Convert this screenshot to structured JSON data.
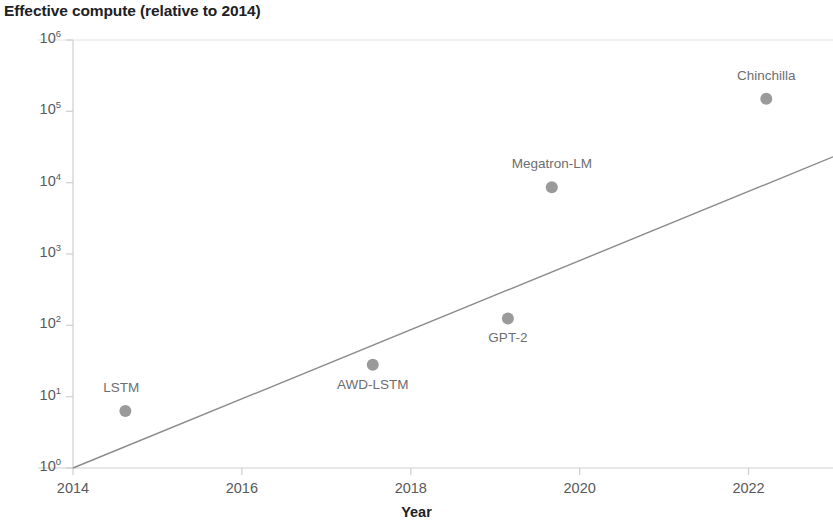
{
  "chart_data": {
    "type": "scatter",
    "title": "Effective compute (relative to 2014)",
    "xlabel": "Year",
    "ylabel": "",
    "xlim": [
      2013.5,
      2023.0
    ],
    "ylim": [
      1,
      1000000
    ],
    "yscale": "log",
    "grid": false,
    "legend": "none",
    "xticks": [
      "2014",
      "2016",
      "2018",
      "2020",
      "2022"
    ],
    "xtick_values": [
      2014,
      2016,
      2018,
      2020,
      2022
    ],
    "yticks": [
      "10^0",
      "10^1",
      "10^2",
      "10^3",
      "10^4",
      "10^5",
      "10^6"
    ],
    "ytick_values": [
      1,
      10,
      100,
      1000,
      10000,
      100000,
      1000000
    ],
    "ytick_mantissa": [
      "10",
      "10",
      "10",
      "10",
      "10",
      "10",
      "10"
    ],
    "ytick_exponent": [
      "0",
      "1",
      "2",
      "3",
      "4",
      "5",
      "6"
    ],
    "points": [
      {
        "name": "LSTM",
        "x": 2014.62,
        "y": 6.3,
        "label_dx": -4,
        "label_dy": -22
      },
      {
        "name": "AWD-LSTM",
        "x": 2017.55,
        "y": 28,
        "label_dx": 0,
        "label_dy": 21
      },
      {
        "name": "GPT-2",
        "x": 2019.15,
        "y": 125,
        "label_dx": 0,
        "label_dy": 21
      },
      {
        "name": "Megatron-LM",
        "x": 2019.67,
        "y": 8600,
        "label_dx": 0,
        "label_dy": -22
      },
      {
        "name": "Chinchilla",
        "x": 2022.21,
        "y": 150000,
        "label_dx": 0,
        "label_dy": -22
      }
    ],
    "trendline": {
      "x_start": 2014.0,
      "y_start": 1,
      "x_end": 2023.0,
      "y_end": 23000
    },
    "colors": {
      "point": "#9a9a9a",
      "trendline": "#8a8a8a",
      "axis": "#cfcfcf",
      "tick_text": "#58595b",
      "title_text": "#202124",
      "point_label": "#6d6e71",
      "background": "#ffffff"
    }
  }
}
